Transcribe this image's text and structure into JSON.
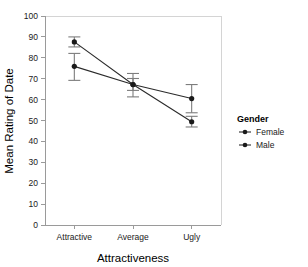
{
  "chart_data": {
    "type": "line",
    "title": "",
    "xlabel": "Attractiveness",
    "ylabel": "Mean Rating of Date",
    "categories": [
      "Attractive",
      "Average",
      "Ugly"
    ],
    "ylim": [
      0,
      100
    ],
    "yticks": [
      0,
      10,
      20,
      30,
      40,
      50,
      60,
      70,
      80,
      90,
      100
    ],
    "ytick_labels": [
      "0",
      "10",
      "20",
      "30",
      "40",
      "50",
      "60",
      "70",
      "80",
      "90",
      "100"
    ],
    "grid": false,
    "legend_position": "right",
    "legend_title": "Gender",
    "error_bars": "confidence-interval",
    "series": [
      {
        "name": "Female",
        "marker": "circle",
        "color": "#1a1a1a",
        "values": [
          75.9,
          67.2,
          60.5
        ],
        "err_low": [
          69.2,
          61.3,
          53.7
        ],
        "err_high": [
          82.1,
          72.5,
          67.2
        ]
      },
      {
        "name": "Male",
        "marker": "circle",
        "color": "#1a1a1a",
        "values": [
          87.6,
          67.2,
          49.4
        ],
        "err_low": [
          85.2,
          64.4,
          46.9
        ],
        "err_high": [
          90.0,
          70.1,
          52.0
        ]
      }
    ]
  },
  "axis": {
    "x_title": "Attractiveness",
    "y_title": "Mean Rating of Date"
  },
  "legend": {
    "title": "Gender",
    "items": [
      {
        "label": "Female"
      },
      {
        "label": "Male"
      }
    ]
  }
}
